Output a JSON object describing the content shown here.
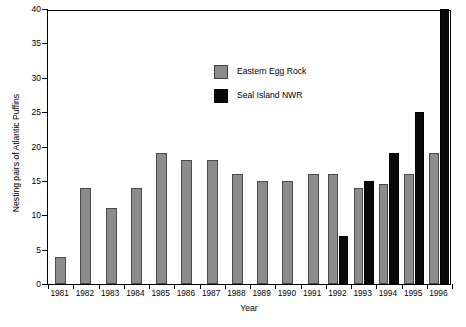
{
  "chart_data": {
    "type": "bar",
    "title": "",
    "xlabel": "Year",
    "ylabel": "Nesting pairs of Atlantic Puffins",
    "categories": [
      "1981",
      "1982",
      "1983",
      "1984",
      "1985",
      "1986",
      "1987",
      "1988",
      "1989",
      "1990",
      "1991",
      "1992",
      "1993",
      "1994",
      "1995",
      "1996"
    ],
    "series": [
      {
        "name": "Eastern Egg Rock",
        "color": "#8c8c8c",
        "values": [
          4,
          14,
          11,
          14,
          19,
          18,
          18,
          16,
          15,
          15,
          16,
          16,
          14,
          14.5,
          16,
          19
        ]
      },
      {
        "name": "Seal Island NWR",
        "color": "#0a0a0a",
        "values": [
          null,
          null,
          null,
          null,
          null,
          null,
          null,
          null,
          null,
          null,
          null,
          7,
          15,
          19,
          25,
          40
        ]
      }
    ],
    "ylim": [
      0,
      40
    ],
    "yticks": [
      0,
      5,
      10,
      15,
      20,
      25,
      30,
      35,
      40
    ],
    "ytick_labels": [
      "0",
      "5",
      "10",
      "15",
      "20",
      "25",
      "30",
      "35",
      "40"
    ],
    "grid": false,
    "legend_position": "upper-center"
  },
  "legend": {
    "items": [
      {
        "label": "Eastern Egg Rock",
        "swatch": "gray-swatch"
      },
      {
        "label": "Seal Island NWR",
        "swatch": "black-swatch"
      }
    ]
  }
}
